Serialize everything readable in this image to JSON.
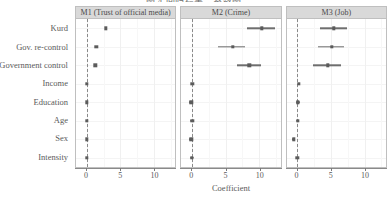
{
  "figure": {
    "title_cut": "图 4  回归结果：系数图",
    "xlabel": "Coefficient"
  },
  "chart_data": {
    "type": "scatter",
    "title": "",
    "xlabel": "Coefficient",
    "ylabel": "",
    "xlim": [
      -1.6,
      13.2
    ],
    "xticks": [
      0,
      5,
      10
    ],
    "xticklabels": [
      "0",
      "5",
      "10"
    ],
    "grid": true,
    "legend": false,
    "reference_line": 0,
    "categories": [
      "Kurd",
      "Gov. re-control",
      "Government control",
      "Income",
      "Education",
      "Age",
      "Sex",
      "Intensity"
    ],
    "panels": [
      {
        "label": "M1 (Trust of official media)",
        "points": [
          {
            "term": "Kurd",
            "estimate": 2.85,
            "low": 2.75,
            "high": 2.95
          },
          {
            "term": "Gov. re-control",
            "estimate": 1.45,
            "low": 1.35,
            "high": 1.55
          },
          {
            "term": "Government control",
            "estimate": 1.25,
            "low": 1.15,
            "high": 1.35
          },
          {
            "term": "Income",
            "estimate": 0.05,
            "low": -0.1,
            "high": 0.2
          },
          {
            "term": "Education",
            "estimate": 0.02,
            "low": -0.12,
            "high": 0.16
          },
          {
            "term": "Age",
            "estimate": 0.0,
            "low": -0.1,
            "high": 0.1
          },
          {
            "term": "Sex",
            "estimate": 0.0,
            "low": -0.14,
            "high": 0.14
          },
          {
            "term": "Intensity",
            "estimate": 0.0,
            "low": -0.1,
            "high": 0.1
          }
        ]
      },
      {
        "label": "M2 (Crime)",
        "points": [
          {
            "term": "Kurd",
            "estimate": 10.4,
            "low": 8.2,
            "high": 12.3
          },
          {
            "term": "Gov. re-control",
            "estimate": 6.1,
            "low": 3.9,
            "high": 7.9
          },
          {
            "term": "Government control",
            "estimate": 8.5,
            "low": 6.7,
            "high": 10.3
          },
          {
            "term": "Income",
            "estimate": 0.05,
            "low": -0.2,
            "high": 0.3
          },
          {
            "term": "Education",
            "estimate": -0.1,
            "low": -0.4,
            "high": 0.2
          },
          {
            "term": "Age",
            "estimate": 0.05,
            "low": -0.25,
            "high": 0.35
          },
          {
            "term": "Sex",
            "estimate": -0.1,
            "low": -0.4,
            "high": 0.2
          },
          {
            "term": "Intensity",
            "estimate": 0.0,
            "low": -0.25,
            "high": 0.25
          }
        ]
      },
      {
        "label": "M3 (Job)",
        "points": [
          {
            "term": "Kurd",
            "estimate": 5.4,
            "low": 3.4,
            "high": 7.4
          },
          {
            "term": "Gov. re-control",
            "estimate": 5.1,
            "low": 3.1,
            "high": 7.0
          },
          {
            "term": "Government control",
            "estimate": 4.5,
            "low": 2.3,
            "high": 6.5
          },
          {
            "term": "Income",
            "estimate": 0.25,
            "low": 0.05,
            "high": 0.45
          },
          {
            "term": "Education",
            "estimate": 0.1,
            "low": -0.15,
            "high": 0.35
          },
          {
            "term": "Age",
            "estimate": 0.05,
            "low": -0.2,
            "high": 0.3
          },
          {
            "term": "Sex",
            "estimate": -0.55,
            "low": -0.8,
            "high": -0.3
          },
          {
            "term": "Intensity",
            "estimate": 0.0,
            "low": -0.25,
            "high": 0.25
          }
        ]
      }
    ]
  },
  "style": {
    "strip_bg": "#d9d9d9",
    "point_color": "#5b5b5b",
    "zero_line_color": "#8a8a8a",
    "panel_border": "#bfbfbf"
  }
}
